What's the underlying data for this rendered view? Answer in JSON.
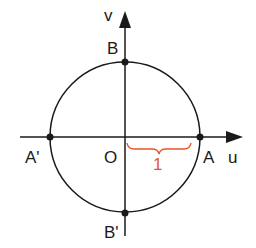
{
  "diagram": {
    "colors": {
      "stroke": "#1a1a1a",
      "accent": "#e8552a",
      "background": "#ffffff"
    },
    "axes": {
      "horizontal_label": "u",
      "vertical_label": "v"
    },
    "points": {
      "origin": "O",
      "A": "A",
      "A_prime": "A'",
      "B": "B",
      "B_prime": "B'"
    },
    "radius_label": "1"
  }
}
